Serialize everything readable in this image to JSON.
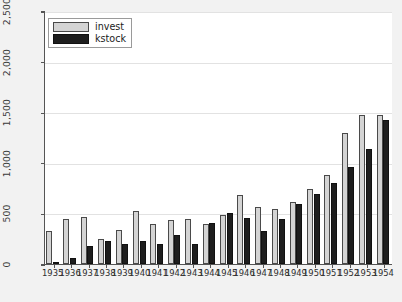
{
  "chart_data": {
    "type": "bar",
    "title": "",
    "xlabel": "",
    "ylabel": "",
    "ylim": [
      0,
      2500
    ],
    "yticks": [
      0,
      500,
      1000,
      1500,
      2000,
      2500
    ],
    "ytick_labels": [
      "0",
      "500",
      "1,000",
      "1,500",
      "2,000",
      "2,500"
    ],
    "grid": true,
    "legend_position": "upper left",
    "categories": [
      "1935",
      "1936",
      "1937",
      "1938",
      "1939",
      "1940",
      "1941",
      "1942",
      "1943",
      "1944",
      "1945",
      "1946",
      "1947",
      "1948",
      "1949",
      "1950",
      "1951",
      "1952",
      "1953",
      "1954"
    ],
    "series": [
      {
        "name": "invest",
        "color": "#d4d4d4",
        "values": [
          330,
          440,
          460,
          250,
          340,
          520,
          400,
          430,
          440,
          400,
          480,
          680,
          560,
          540,
          610,
          740,
          880,
          1290,
          1470,
          1470
        ]
      },
      {
        "name": "kstock",
        "color": "#1e1e1e",
        "values": [
          15,
          60,
          180,
          230,
          200,
          230,
          200,
          290,
          200,
          410,
          500,
          450,
          330,
          440,
          590,
          690,
          800,
          960,
          1140,
          1420
        ]
      }
    ]
  },
  "legend": {
    "items": [
      {
        "label": "invest",
        "swatch": "invest"
      },
      {
        "label": "kstock",
        "swatch": "kstock"
      }
    ]
  }
}
